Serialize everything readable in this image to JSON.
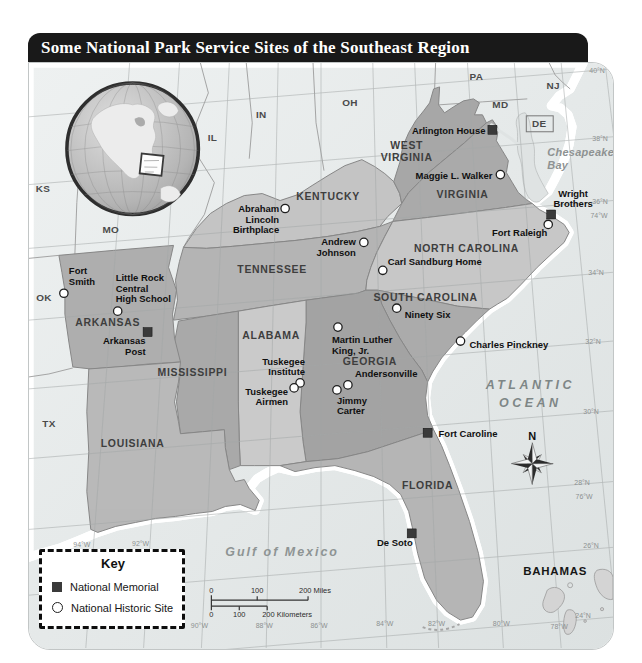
{
  "title": "Some National Park Service Sites of the Southeast Region",
  "colors": {
    "title_bar": "#191919",
    "title_text": "#ffffff",
    "ocean": "#e9ecec",
    "bay_water": "#dfe3e3",
    "outside_land": "#d8d8d8",
    "memorial_marker": "#3a3a3a",
    "historic_marker_fill": "#ffffff",
    "historic_marker_stroke": "#1f1f1f"
  },
  "key": {
    "title": "Key",
    "items": [
      {
        "marker": "square",
        "label": "National Memorial"
      },
      {
        "marker": "circle",
        "label": "National Historic Site"
      }
    ]
  },
  "compass": {
    "label": "N"
  },
  "scale_bar": {
    "miles_labels": [
      {
        "t": "0",
        "x": 183
      },
      {
        "t": "100",
        "x": 229
      },
      {
        "t": "200 Miles",
        "x": 287
      }
    ],
    "km_labels": [
      {
        "t": "0",
        "x": 183
      },
      {
        "t": "100",
        "x": 211
      },
      {
        "t": "200 Kilometers",
        "x": 259
      }
    ]
  },
  "region_states": [
    {
      "name": "KENTUCKY",
      "x": 300,
      "y": 137,
      "fill": "#c4c4c4"
    },
    {
      "name": "TENNESSEE",
      "x": 244,
      "y": 211,
      "fill": "#b4b4b4"
    },
    {
      "name": "WEST VIRGINIA",
      "lines": [
        "WEST",
        "VIRGINIA"
      ],
      "x": 379,
      "y": 86,
      "fill": "#a7a7a7"
    },
    {
      "name": "VIRGINIA",
      "x": 435,
      "y": 135,
      "fill": "#aaaaaa"
    },
    {
      "name": "NORTH CAROLINA",
      "x": 439,
      "y": 190,
      "fill": "#c7c7c7"
    },
    {
      "name": "SOUTH CAROLINA",
      "x": 398,
      "y": 239,
      "fill": "#ababab"
    },
    {
      "name": "GEORGIA",
      "x": 342,
      "y": 303,
      "fill": "#a3a3a3"
    },
    {
      "name": "ALABAMA",
      "x": 243,
      "y": 277,
      "fill": "#cacaca"
    },
    {
      "name": "MISSISSIPPI",
      "x": 164,
      "y": 314,
      "fill": "#a9a9a9"
    },
    {
      "name": "ARKANSAS",
      "x": 79,
      "y": 264,
      "fill": "#aeaeae"
    },
    {
      "name": "LOUISIANA",
      "x": 104,
      "y": 385,
      "fill": "#b9b9b9"
    },
    {
      "name": "FLORIDA",
      "x": 400,
      "y": 427,
      "fill": "#b5b5b5"
    }
  ],
  "outside_states": [
    {
      "name": "KS",
      "x": 14,
      "y": 129
    },
    {
      "name": "MO",
      "x": 82,
      "y": 171
    },
    {
      "name": "OK",
      "x": 15,
      "y": 239
    },
    {
      "name": "TX",
      "x": 20,
      "y": 365
    },
    {
      "name": "IL",
      "x": 184,
      "y": 78
    },
    {
      "name": "IN",
      "x": 233,
      "y": 55
    },
    {
      "name": "OH",
      "x": 322,
      "y": 43
    },
    {
      "name": "PA",
      "x": 449,
      "y": 17
    },
    {
      "name": "NJ",
      "x": 526,
      "y": 26
    },
    {
      "name": "MD",
      "x": 473,
      "y": 45
    },
    {
      "name": "DE",
      "x": 512,
      "y": 64
    }
  ],
  "countries": [
    {
      "name": "BAHAMAS",
      "x": 528,
      "y": 514
    }
  ],
  "water_labels": [
    {
      "name": "Chesapeake Bay",
      "lines": [
        "Chesapeake",
        "Bay"
      ],
      "x": 520,
      "y": 93,
      "size": 11,
      "spacing": 0.3,
      "anchor": "start",
      "fill": "#8e9292",
      "lh": 13
    },
    {
      "name": "Atlantic Ocean",
      "lines": [
        "ATLANTIC",
        "OCEAN"
      ],
      "x": 503,
      "y": 327,
      "size": 12.5,
      "spacing": 3.5,
      "anchor": "middle",
      "fill": "#7e8686",
      "lh": 18
    },
    {
      "name": "Gulf of Mexico",
      "lines": [
        "Gulf of Mexico"
      ],
      "x": 254,
      "y": 495,
      "size": 12.5,
      "spacing": 2,
      "anchor": "middle",
      "fill": "#8e9494",
      "lh": 14
    }
  ],
  "sites": [
    {
      "name": "Arlington House",
      "type": "memorial",
      "mx": 465,
      "my": 67,
      "lines": [
        "Arlington House"
      ],
      "tx": 458,
      "ty": 71,
      "anchor": "end"
    },
    {
      "name": "Maggie L. Walker",
      "type": "historic_site",
      "mx": 473,
      "my": 112,
      "lines": [
        "Maggie L. Walker"
      ],
      "tx": 465,
      "ty": 116,
      "anchor": "end"
    },
    {
      "name": "Wright Brothers",
      "type": "memorial",
      "mx": 524,
      "my": 152,
      "lines": [
        "Wright",
        "Brothers"
      ],
      "tx": 546,
      "ty": 134,
      "anchor": "middle"
    },
    {
      "name": "Fort Raleigh",
      "type": "historic_site",
      "mx": 521,
      "my": 162,
      "lines": [
        "Fort Raleigh"
      ],
      "tx": 520,
      "ty": 174,
      "anchor": "end"
    },
    {
      "name": "Abraham Lincoln Birthplace",
      "type": "historic_site",
      "mx": 257,
      "my": 146,
      "lines": [
        "Abraham",
        "Lincoln",
        "Birthplace"
      ],
      "tx": 251,
      "ty": 150,
      "anchor": "end"
    },
    {
      "name": "Andrew Johnson",
      "type": "historic_site",
      "mx": 336,
      "my": 180,
      "lines": [
        "Andrew",
        "Johnson"
      ],
      "tx": 328,
      "ty": 183,
      "anchor": "end"
    },
    {
      "name": "Carl Sandburg Home",
      "type": "historic_site",
      "mx": 355,
      "my": 208,
      "lines": [
        "Carl Sandburg Home"
      ],
      "tx": 360,
      "ty": 203,
      "anchor": "start"
    },
    {
      "name": "Ninety Six",
      "type": "historic_site",
      "mx": 369,
      "my": 246,
      "lines": [
        "Ninety Six"
      ],
      "tx": 377,
      "ty": 256,
      "anchor": "start"
    },
    {
      "name": "Charles Pinckney",
      "type": "historic_site",
      "mx": 433,
      "my": 279,
      "lines": [
        "Charles Pinckney"
      ],
      "tx": 442,
      "ty": 286,
      "anchor": "start"
    },
    {
      "name": "Martin Luther King, Jr.",
      "type": "historic_site",
      "mx": 310,
      "my": 265,
      "lines": [
        "Martin Luther",
        "King, Jr."
      ],
      "tx": 304,
      "ty": 281,
      "anchor": "start"
    },
    {
      "name": "Andersonville",
      "type": "historic_site",
      "mx": 320,
      "my": 323,
      "lines": [
        "Andersonville"
      ],
      "tx": 327,
      "ty": 315,
      "anchor": "start"
    },
    {
      "name": "Jimmy Carter",
      "type": "historic_site",
      "mx": 309,
      "my": 328,
      "lines": [
        "Jimmy",
        "Carter"
      ],
      "tx": 309,
      "ty": 342,
      "anchor": "start"
    },
    {
      "name": "Tuskegee Institute",
      "type": "historic_site",
      "mx": 272,
      "my": 321,
      "lines": [
        "Tuskegee",
        "Institute"
      ],
      "tx": 277,
      "ty": 303,
      "anchor": "end"
    },
    {
      "name": "Tuskegee Airmen",
      "type": "historic_site",
      "mx": 266,
      "my": 326,
      "lines": [
        "Tuskegee",
        "Airmen"
      ],
      "tx": 260,
      "ty": 333,
      "anchor": "end"
    },
    {
      "name": "Fort Smith",
      "type": "historic_site",
      "mx": 35,
      "my": 231,
      "lines": [
        "Fort",
        "Smith"
      ],
      "tx": 40,
      "ty": 212,
      "anchor": "start"
    },
    {
      "name": "Little Rock Central High School",
      "type": "historic_site",
      "mx": 89,
      "my": 249,
      "lines": [
        "Little Rock",
        "Central",
        "High School"
      ],
      "tx": 87,
      "ty": 219,
      "anchor": "start"
    },
    {
      "name": "Arkansas Post",
      "type": "memorial",
      "mx": 119,
      "my": 270,
      "lines": [
        "Arkansas",
        "Post"
      ],
      "tx": 117,
      "ty": 282,
      "anchor": "end"
    },
    {
      "name": "Fort Caroline",
      "type": "memorial",
      "mx": 400,
      "my": 371,
      "lines": [
        "Fort Caroline"
      ],
      "tx": 411,
      "ty": 375,
      "anchor": "start"
    },
    {
      "name": "De Soto",
      "type": "memorial",
      "mx": 384,
      "my": 472,
      "lines": [
        "De Soto"
      ],
      "tx": 385,
      "ty": 485,
      "anchor": "end"
    }
  ],
  "graticule_labels": [
    {
      "t": "40°N",
      "x": 570,
      "y": 10
    },
    {
      "t": "38°N",
      "x": 573,
      "y": 78
    },
    {
      "t": "36°N",
      "x": 573,
      "y": 141
    },
    {
      "t": "74°W",
      "x": 572,
      "y": 156
    },
    {
      "t": "34°N",
      "x": 569,
      "y": 213
    },
    {
      "t": "32°N",
      "x": 566,
      "y": 282
    },
    {
      "t": "30°N",
      "x": 564,
      "y": 352
    },
    {
      "t": "28°N",
      "x": 555,
      "y": 423
    },
    {
      "t": "76°W",
      "x": 557,
      "y": 437
    },
    {
      "t": "26°N",
      "x": 564,
      "y": 487
    },
    {
      "t": "24°N",
      "x": 556,
      "y": 557
    },
    {
      "t": "94°W",
      "x": 53,
      "y": 486
    },
    {
      "t": "92°W",
      "x": 112,
      "y": 485
    },
    {
      "t": "90°W",
      "x": 171,
      "y": 567
    },
    {
      "t": "88°W",
      "x": 236,
      "y": 567
    },
    {
      "t": "86°W",
      "x": 291,
      "y": 567
    },
    {
      "t": "84°W",
      "x": 357,
      "y": 565
    },
    {
      "t": "82°W",
      "x": 409,
      "y": 565
    },
    {
      "t": "80°W",
      "x": 474,
      "y": 565
    },
    {
      "t": "78°W",
      "x": 532,
      "y": 568
    }
  ]
}
